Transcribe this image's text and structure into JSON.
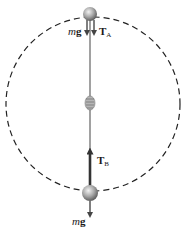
{
  "diagram": {
    "circle": {
      "cx": 93,
      "cy": 104,
      "r": 87,
      "stroke": "#222222",
      "dash": "6 4"
    },
    "string": {
      "x1": 90,
      "y1": 14,
      "x2": 90,
      "y2": 193,
      "color": "#8a8a8a"
    },
    "knot": {
      "cx": 90,
      "cy": 103
    },
    "balls": [
      {
        "name": "top-ball",
        "cx": 90,
        "cy": 14,
        "r": 7
      },
      {
        "name": "bottom-ball",
        "cx": 90,
        "cy": 193,
        "r": 8
      }
    ],
    "labels": {
      "mg_top": {
        "italic": "m",
        "bold": "g"
      },
      "ta": {
        "bold": "T",
        "sub": "A"
      },
      "tb": {
        "bold": "T",
        "sub": "B"
      },
      "mg_bottom": {
        "italic": "m",
        "bold": "g"
      }
    },
    "colors": {
      "ball_light": "#d9d9d9",
      "ball_dark": "#6e6e6e",
      "arrow": "#444444",
      "arrow_tb": "#333333"
    }
  }
}
